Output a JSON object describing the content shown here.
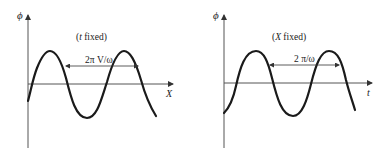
{
  "panels": [
    {
      "id": "left",
      "y_axis_label": "ϕ",
      "x_axis_label": "X",
      "condition_label": "(t fixed)",
      "condition_var": "t",
      "condition_text": " fixed)",
      "period_label": "2π V/ω"
    },
    {
      "id": "right",
      "y_axis_label": "ϕ",
      "x_axis_label": "t",
      "condition_label": "(X fixed)",
      "condition_var": "X",
      "condition_text": " fixed)",
      "period_label": "2 π/ω"
    }
  ],
  "colors": {
    "curve": "#1a1a1a",
    "axis": "#555555",
    "text": "#222222"
  }
}
